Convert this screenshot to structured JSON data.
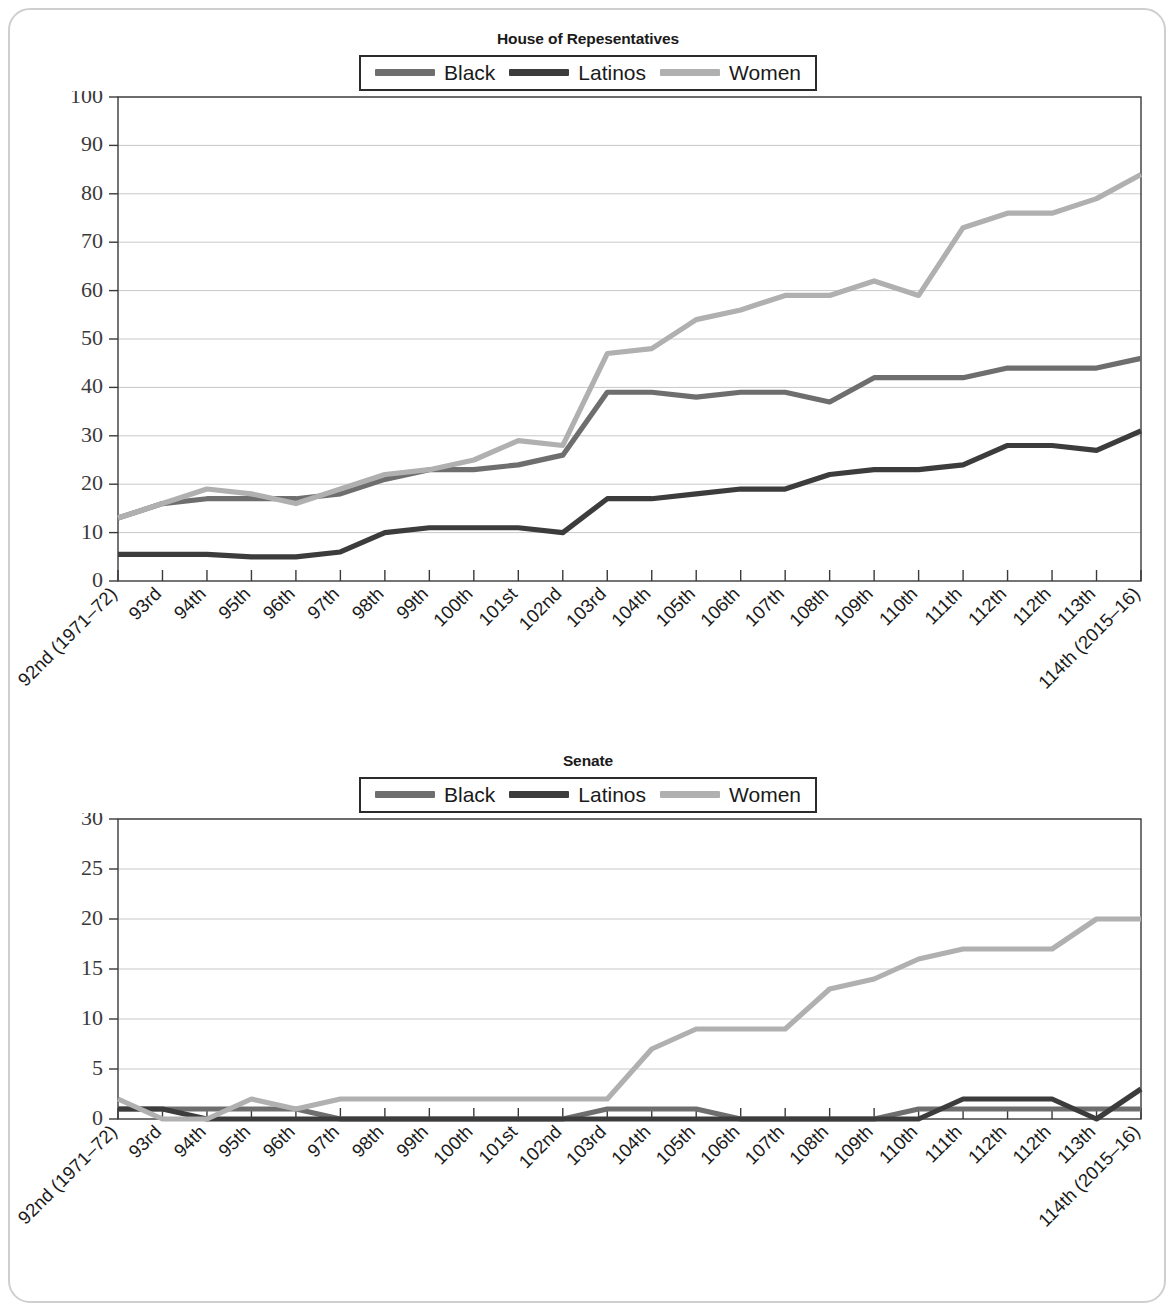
{
  "figure": {
    "background_color": "#ffffff",
    "frame_border_color": "#cfcfcf"
  },
  "series_colors": {
    "black": "#6e6e6e",
    "latinos": "#3c3c3c",
    "women": "#b0b0b0"
  },
  "categories": [
    "92nd (1971–72)",
    "93rd",
    "94th",
    "95th",
    "96th",
    "97th",
    "98th",
    "99th",
    "100th",
    "101st",
    "102nd",
    "103rd",
    "104th",
    "105th",
    "106th",
    "107th",
    "108th",
    "109th",
    "110th",
    "111th",
    "112th",
    "112th",
    "113th",
    "114th (2015–16)"
  ],
  "chart_data": [
    {
      "id": "house",
      "type": "line",
      "title": "House of Repesentatives",
      "xlabel": "",
      "ylabel": "",
      "ylim": [
        0,
        100
      ],
      "ytick_step": 10,
      "yticks": [
        0,
        10,
        20,
        30,
        40,
        50,
        60,
        70,
        80,
        90,
        100
      ],
      "grid": true,
      "legend_position": "top-center",
      "categories": [
        "92nd (1971–72)",
        "93rd",
        "94th",
        "95th",
        "96th",
        "97th",
        "98th",
        "99th",
        "100th",
        "101st",
        "102nd",
        "103rd",
        "104th",
        "105th",
        "106th",
        "107th",
        "108th",
        "109th",
        "110th",
        "111th",
        "112th",
        "112th",
        "113th",
        "114th (2015–16)"
      ],
      "series": [
        {
          "name": "Black",
          "color": "#6e6e6e",
          "values": [
            13,
            16,
            17,
            17,
            17,
            18,
            21,
            23,
            23,
            24,
            26,
            39,
            39,
            38,
            39,
            39,
            37,
            42,
            42,
            42,
            44,
            44,
            44,
            46
          ]
        },
        {
          "name": "Latinos",
          "color": "#3c3c3c",
          "values": [
            5.5,
            5.5,
            5.5,
            5,
            5,
            6,
            10,
            11,
            11,
            11,
            10,
            17,
            17,
            18,
            19,
            19,
            22,
            23,
            23,
            24,
            28,
            28,
            27,
            31
          ]
        },
        {
          "name": "Women",
          "color": "#b0b0b0",
          "values": [
            13,
            16,
            19,
            18,
            16,
            19,
            22,
            23,
            25,
            29,
            28,
            47,
            48,
            54,
            56,
            59,
            59,
            62,
            59,
            73,
            76,
            76,
            79,
            84
          ]
        }
      ]
    },
    {
      "id": "senate",
      "type": "line",
      "title": "Senate",
      "xlabel": "",
      "ylabel": "",
      "ylim": [
        0,
        30
      ],
      "ytick_step": 5,
      "yticks": [
        0,
        5,
        10,
        15,
        20,
        25,
        30
      ],
      "grid": true,
      "legend_position": "top-center",
      "categories": [
        "92nd (1971–72)",
        "93rd",
        "94th",
        "95th",
        "96th",
        "97th",
        "98th",
        "99th",
        "100th",
        "101st",
        "102nd",
        "103rd",
        "104th",
        "105th",
        "106th",
        "107th",
        "108th",
        "109th",
        "110th",
        "111th",
        "112th",
        "112th",
        "113th",
        "114th (2015–16)"
      ],
      "series": [
        {
          "name": "Black",
          "color": "#6e6e6e",
          "values": [
            1,
            1,
            1,
            1,
            1,
            0,
            0,
            0,
            0,
            0,
            0,
            1,
            1,
            1,
            0,
            0,
            0,
            0,
            1,
            1,
            1,
            1,
            1,
            1
          ]
        },
        {
          "name": "Latinos",
          "color": "#3c3c3c",
          "values": [
            1,
            1,
            0,
            0,
            0,
            0,
            0,
            0,
            0,
            0,
            0,
            0,
            0,
            0,
            0,
            0,
            0,
            0,
            0,
            2,
            2,
            2,
            0,
            3
          ]
        },
        {
          "name": "Women",
          "color": "#b0b0b0",
          "values": [
            2,
            0,
            0,
            2,
            1,
            2,
            2,
            2,
            2,
            2,
            2,
            2,
            7,
            9,
            9,
            9,
            13,
            14,
            16,
            17,
            17,
            17,
            20,
            20
          ]
        }
      ]
    }
  ],
  "house": {
    "title": "House of Repesentatives",
    "legend": [
      {
        "label": "Black",
        "color": "#6e6e6e"
      },
      {
        "label": "Latinos",
        "color": "#3c3c3c"
      },
      {
        "label": "Women",
        "color": "#b0b0b0"
      }
    ]
  },
  "senate": {
    "title": "Senate",
    "legend": [
      {
        "label": "Black",
        "color": "#6e6e6e"
      },
      {
        "label": "Latinos",
        "color": "#3c3c3c"
      },
      {
        "label": "Women",
        "color": "#b0b0b0"
      }
    ]
  }
}
